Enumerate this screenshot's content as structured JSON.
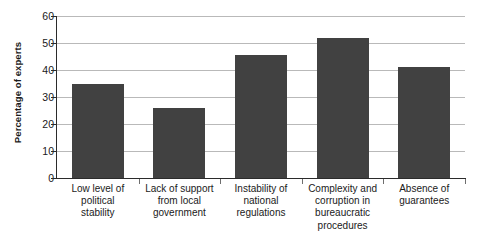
{
  "chart_data": {
    "type": "bar",
    "title": "",
    "subtitle": "",
    "xlabel": "",
    "ylabel": "Percentage of experts",
    "ylim": [
      0,
      60
    ],
    "yticks": [
      0,
      10,
      20,
      30,
      40,
      50,
      60
    ],
    "ytick_labels": [
      "0",
      "10",
      "20",
      "30",
      "40",
      "50",
      "60"
    ],
    "grid": true,
    "legend": false,
    "legend_position": "none",
    "bar_color": "#414141",
    "gridline_color": "#b9b9b9",
    "axis_color": "#2b2b2b",
    "categories": [
      "Low level of political stability",
      "Lack of support from local government",
      "Instability of national regulations",
      "Complexity and corruption in bureaucratic procedures",
      "Absence of guarantees"
    ],
    "category_lines": [
      [
        "Low level of",
        "political",
        "stability"
      ],
      [
        "Lack of support",
        "from local",
        "government"
      ],
      [
        "Instability of",
        "national",
        "regulations"
      ],
      [
        "Complexity and",
        "corruption in",
        "bureaucratic",
        "procedures"
      ],
      [
        "Absence of",
        "guarantees"
      ]
    ],
    "values": [
      35,
      26,
      45.5,
      52,
      41
    ]
  }
}
